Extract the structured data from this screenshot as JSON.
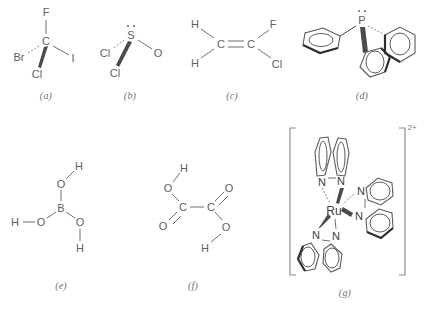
{
  "figure": {
    "width": 433,
    "height": 311,
    "background": "#ffffff",
    "line_color": "#6e6f73",
    "text_color": "#5f6064",
    "charge_color": "#4f8f62"
  },
  "panels": [
    {
      "id": "a",
      "label": "(a)",
      "name": "bromochlorofluoroiodomethane",
      "atoms": [
        {
          "symbol": "F",
          "x": 46,
          "y": 12
        },
        {
          "symbol": "C",
          "x": 46,
          "y": 41
        },
        {
          "symbol": "Br",
          "x": 19,
          "y": 57
        },
        {
          "symbol": "Cl",
          "x": 37,
          "y": 74
        },
        {
          "symbol": "I",
          "x": 73,
          "y": 58
        }
      ]
    },
    {
      "id": "b",
      "label": "(b)",
      "name": "thionyl-chloride",
      "atoms": [
        {
          "symbol": "S",
          "x": 131,
          "y": 35
        },
        {
          "symbol": "Cl",
          "x": 105,
          "y": 53
        },
        {
          "symbol": "Cl",
          "x": 115,
          "y": 73
        },
        {
          "symbol": "O",
          "x": 158,
          "y": 53
        }
      ]
    },
    {
      "id": "c",
      "label": "(c)",
      "name": "1-chloro-1-fluoroethene",
      "atoms": [
        {
          "symbol": "H",
          "x": 195,
          "y": 24
        },
        {
          "symbol": "H",
          "x": 195,
          "y": 63
        },
        {
          "symbol": "C",
          "x": 221,
          "y": 44
        },
        {
          "symbol": "C",
          "x": 251,
          "y": 44
        },
        {
          "symbol": "F",
          "x": 273,
          "y": 24
        },
        {
          "symbol": "Cl",
          "x": 277,
          "y": 64
        }
      ]
    },
    {
      "id": "d",
      "label": "(d)",
      "name": "triphenylphosphine",
      "atoms": [
        {
          "symbol": "P",
          "x": 362,
          "y": 20
        }
      ]
    },
    {
      "id": "e",
      "label": "(e)",
      "name": "boric-acid",
      "atoms": [
        {
          "symbol": "H",
          "x": 79,
          "y": 166
        },
        {
          "symbol": "O",
          "x": 61,
          "y": 184
        },
        {
          "symbol": "B",
          "x": 61,
          "y": 208
        },
        {
          "symbol": "H",
          "x": 15,
          "y": 222
        },
        {
          "symbol": "O",
          "x": 41,
          "y": 222
        },
        {
          "symbol": "O",
          "x": 80,
          "y": 222
        },
        {
          "symbol": "H",
          "x": 80,
          "y": 248
        }
      ]
    },
    {
      "id": "f",
      "label": "(f)",
      "name": "oxalic-acid",
      "atoms": [
        {
          "symbol": "H",
          "x": 184,
          "y": 168
        },
        {
          "symbol": "O",
          "x": 168,
          "y": 188
        },
        {
          "symbol": "C",
          "x": 183,
          "y": 207
        },
        {
          "symbol": "O",
          "x": 163,
          "y": 226
        },
        {
          "symbol": "C",
          "x": 211,
          "y": 207
        },
        {
          "symbol": "O",
          "x": 229,
          "y": 188
        },
        {
          "symbol": "O",
          "x": 226,
          "y": 227
        },
        {
          "symbol": "H",
          "x": 205,
          "y": 248
        }
      ]
    },
    {
      "id": "g",
      "label": "(g)",
      "name": "ruthenium-tris-bipyridine-dication",
      "charge": "2+",
      "atoms": [
        {
          "symbol": "Ru",
          "x": 334,
          "y": 211
        },
        {
          "symbol": "N",
          "x": 322,
          "y": 182
        },
        {
          "symbol": "N",
          "x": 341,
          "y": 181
        },
        {
          "symbol": "N",
          "x": 361,
          "y": 191
        },
        {
          "symbol": "N",
          "x": 359,
          "y": 216
        },
        {
          "symbol": "N",
          "x": 316,
          "y": 235
        },
        {
          "symbol": "N",
          "x": 336,
          "y": 236
        }
      ]
    }
  ],
  "labels": {
    "a": "(a)",
    "b": "(b)",
    "c": "(c)",
    "d": "(d)",
    "e": "(e)",
    "f": "(f)",
    "g": "(g)"
  },
  "label_positions": [
    {
      "key": "a",
      "x": 46,
      "y": 95
    },
    {
      "key": "b",
      "x": 130,
      "y": 95
    },
    {
      "key": "c",
      "x": 232,
      "y": 95
    },
    {
      "key": "d",
      "x": 362,
      "y": 95
    },
    {
      "key": "e",
      "x": 61,
      "y": 285
    },
    {
      "key": "f",
      "x": 193,
      "y": 285
    },
    {
      "key": "g",
      "x": 345,
      "y": 292
    }
  ]
}
